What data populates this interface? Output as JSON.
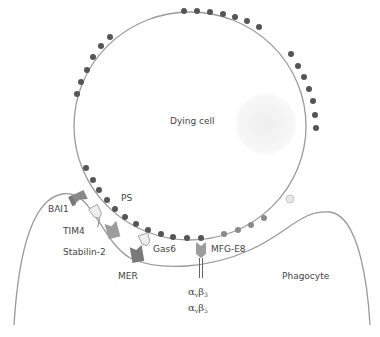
{
  "diagram": {
    "labels": {
      "dying_cell": "Dying cell",
      "phagocyte": "Phagocyte",
      "ps": "PS",
      "bai1": "BAI1",
      "tim4": "TIM4",
      "stabilin2": "Stabilin-2",
      "mer": "MER",
      "gas6": "Gas6",
      "mfge8": "MFG-E8",
      "integrin_1_alpha": "α",
      "integrin_1_sub_alpha": "v",
      "integrin_1_beta": "β",
      "integrin_1_sub_beta": "3",
      "integrin_2_alpha": "α",
      "integrin_2_sub_alpha": "v",
      "integrin_2_beta": "β",
      "integrin_2_sub_beta": "5"
    },
    "colors": {
      "membrane": "#9a9a9a",
      "ps_dot": "#555555",
      "ps_dot_light": "#8a8a8a",
      "receptor_dark": "#7a7a7a",
      "receptor_mid": "#9c9c9c",
      "bridge_light": "#e4e4e4",
      "nucleus": "#efefef"
    }
  }
}
